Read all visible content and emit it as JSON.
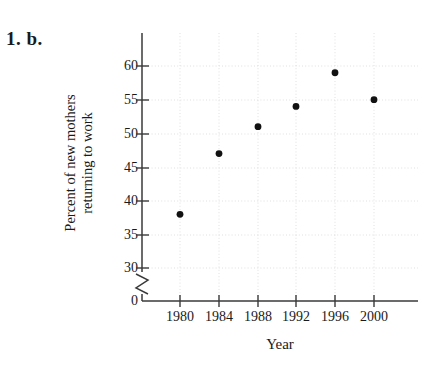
{
  "problem": {
    "label": "1. b."
  },
  "chart_data": {
    "type": "scatter",
    "title": "",
    "xlabel": "Year",
    "ylabel_lines": [
      "Percent of new mothers",
      "returning to work"
    ],
    "ylabel": "Percent of new mothers returning to work",
    "x": [
      1980,
      1984,
      1988,
      1992,
      1996,
      2000
    ],
    "values": [
      38,
      47,
      51,
      54,
      59,
      55
    ],
    "categories": [
      "1980",
      "1984",
      "1988",
      "1992",
      "1996",
      "2000"
    ],
    "xtick_labels": [
      "1980",
      "1984",
      "1988",
      "1992",
      "1996",
      "2000"
    ],
    "ytick_labels": [
      "60",
      "55",
      "50",
      "45",
      "40",
      "35",
      "30",
      "0"
    ],
    "ytick_values": [
      60,
      55,
      50,
      45,
      40,
      35,
      30,
      0
    ],
    "ylim": [
      30,
      62
    ],
    "xlim": [
      1978,
      2002
    ],
    "axis_break": true,
    "axis_break_axis": "y",
    "grid": true,
    "legend": "none",
    "marker": "filled-circle",
    "marker_color": "#111111",
    "grid_color": "#d8d8d8",
    "axis_color": "#3a3a3a",
    "background": "#ffffff"
  }
}
